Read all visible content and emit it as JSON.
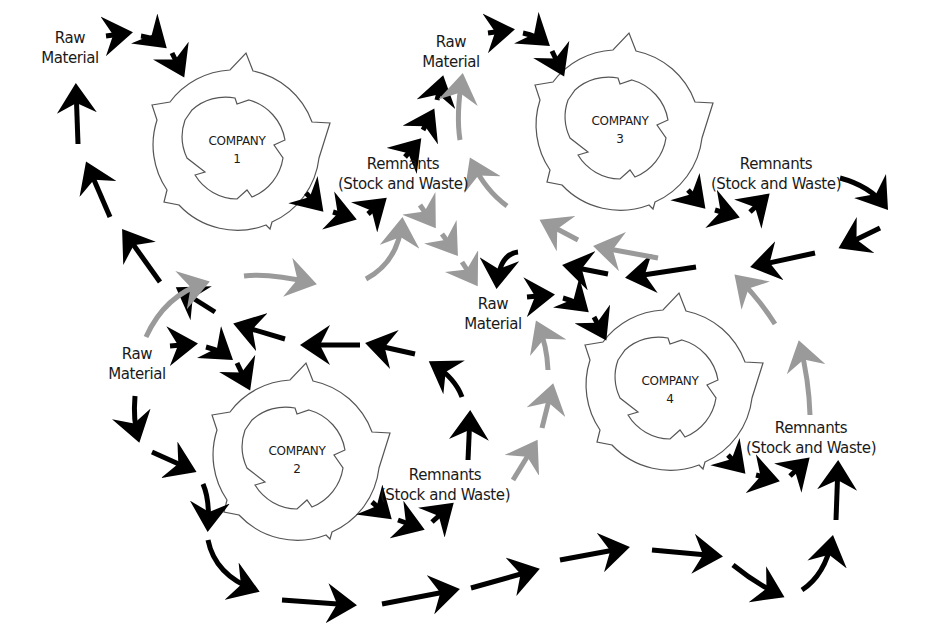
{
  "colors": {
    "flow_primary": "#000000",
    "flow_secondary": "#9a9a9a",
    "ring_stroke": "#555555",
    "background": "#ffffff"
  },
  "labels": {
    "raw1": [
      "Raw",
      "Material"
    ],
    "raw3": [
      "Raw",
      "Material"
    ],
    "raw4": [
      "Raw",
      "Material"
    ],
    "raw2": [
      "Raw",
      "Material"
    ],
    "rem1": [
      "Remnants",
      "(Stock and Waste)"
    ],
    "rem3": [
      "Remnants",
      "(Stock and Waste)"
    ],
    "rem2": [
      "Remnants",
      "(Stock and Waste)"
    ],
    "rem4": [
      "Remnants",
      "(Stock and Waste)"
    ]
  },
  "companies": [
    {
      "name": "COMPANY",
      "number": "1"
    },
    {
      "name": "COMPANY",
      "number": "2"
    },
    {
      "name": "COMPANY",
      "number": "3"
    },
    {
      "name": "COMPANY",
      "number": "4"
    }
  ]
}
